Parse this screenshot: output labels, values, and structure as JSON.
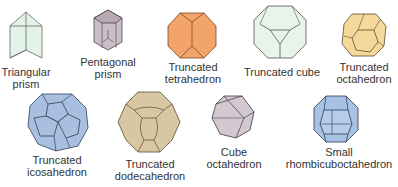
{
  "figure": {
    "items": [
      {
        "id": "triangular-prism",
        "label_line1": "Triangular",
        "label_line2": "prism",
        "fill": "#e4f3e8",
        "stroke": "#555555"
      },
      {
        "id": "pentagonal-prism",
        "label_line1": "Pentagonal",
        "label_line2": "prism",
        "fill": "#cbbec8",
        "stroke": "#4a4048"
      },
      {
        "id": "truncated-tetrahedron",
        "label_line1": "Truncated",
        "label_line2": "tetrahedron",
        "fill": "#f2a46a",
        "stroke": "#6a4020"
      },
      {
        "id": "truncated-cube",
        "label_line1": "Truncated cube",
        "label_line2": "",
        "fill": "#e6f4ea",
        "stroke": "#555555"
      },
      {
        "id": "truncated-octahedron",
        "label_line1": "Truncated",
        "label_line2": "octahedron",
        "fill": "#f6d99a",
        "stroke": "#5a4a30"
      },
      {
        "id": "truncated-icosahedron",
        "label_line1": "Truncated",
        "label_line2": "icosahedron",
        "fill": "#a9bfdf",
        "stroke": "#2f3f5a"
      },
      {
        "id": "truncated-dodecahedron",
        "label_line1": "Truncated",
        "label_line2": "dodecahedron",
        "fill": "#d8c7a3",
        "stroke": "#5e4a30"
      },
      {
        "id": "cube-octahedron",
        "label_line1": "Cube",
        "label_line2": "octahedron",
        "fill": "#d3c8cf",
        "stroke": "#3e3a3e"
      },
      {
        "id": "small-rhombicuboctahedron",
        "label_line1": "Small",
        "label_line2": "rhombicuboctahedron",
        "fill": "#a8c2e6",
        "stroke": "#2c3a55"
      }
    ]
  }
}
